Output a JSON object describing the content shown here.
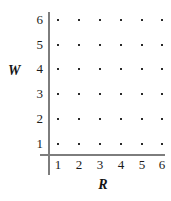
{
  "chart_data": {
    "type": "scatter",
    "title": "",
    "subtitle": "",
    "xlabel": "R",
    "ylabel": "W",
    "x_ticks": [
      "1",
      "2",
      "3",
      "4",
      "5",
      "6"
    ],
    "y_ticks": [
      "1",
      "2",
      "3",
      "4",
      "5",
      "6"
    ],
    "xlim": [
      0.5,
      6.5
    ],
    "ylim": [
      0.5,
      6.5
    ],
    "grid": false,
    "legend": null,
    "annotations": [],
    "series": [
      {
        "name": "sample-space",
        "marker": "square-dot",
        "color": "#2a2a2a",
        "points": [
          {
            "x": 1,
            "y": 1
          },
          {
            "x": 2,
            "y": 1
          },
          {
            "x": 3,
            "y": 1
          },
          {
            "x": 4,
            "y": 1
          },
          {
            "x": 5,
            "y": 1
          },
          {
            "x": 6,
            "y": 1
          },
          {
            "x": 1,
            "y": 2
          },
          {
            "x": 2,
            "y": 2
          },
          {
            "x": 3,
            "y": 2
          },
          {
            "x": 4,
            "y": 2
          },
          {
            "x": 5,
            "y": 2
          },
          {
            "x": 6,
            "y": 2
          },
          {
            "x": 1,
            "y": 3
          },
          {
            "x": 2,
            "y": 3
          },
          {
            "x": 3,
            "y": 3
          },
          {
            "x": 4,
            "y": 3
          },
          {
            "x": 5,
            "y": 3
          },
          {
            "x": 6,
            "y": 3
          },
          {
            "x": 1,
            "y": 4
          },
          {
            "x": 2,
            "y": 4
          },
          {
            "x": 3,
            "y": 4
          },
          {
            "x": 4,
            "y": 4
          },
          {
            "x": 5,
            "y": 4
          },
          {
            "x": 6,
            "y": 4
          },
          {
            "x": 1,
            "y": 5
          },
          {
            "x": 2,
            "y": 5
          },
          {
            "x": 3,
            "y": 5
          },
          {
            "x": 4,
            "y": 5
          },
          {
            "x": 5,
            "y": 5
          },
          {
            "x": 6,
            "y": 5
          },
          {
            "x": 1,
            "y": 6
          },
          {
            "x": 2,
            "y": 6
          },
          {
            "x": 3,
            "y": 6
          },
          {
            "x": 4,
            "y": 6
          },
          {
            "x": 5,
            "y": 6
          },
          {
            "x": 6,
            "y": 6
          }
        ]
      }
    ],
    "colors": {
      "axis": "#7d7d7d",
      "marker": "#2a2a2a",
      "text": "#1a1a1a",
      "background": "#ffffff"
    }
  },
  "layout": {
    "x_pixels": [
      58,
      79,
      100,
      121,
      142,
      162
    ],
    "y_pixels": [
      144,
      119,
      94,
      69,
      45,
      20
    ]
  }
}
